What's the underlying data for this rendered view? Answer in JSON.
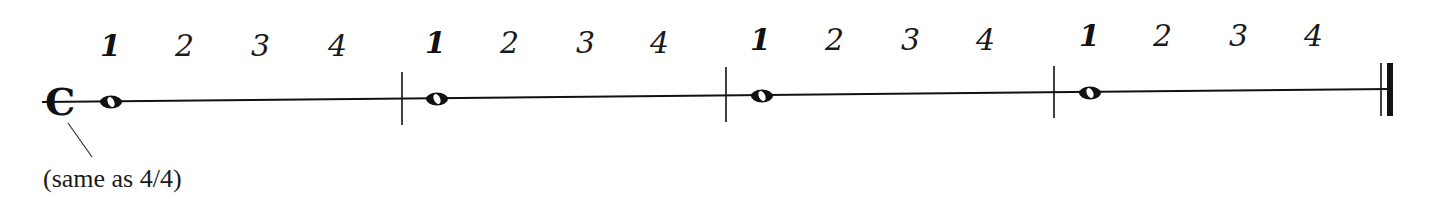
{
  "diagram": {
    "time_signature": {
      "symbol": "C",
      "meaning": "common time",
      "annotation": "(same as 4/4)"
    },
    "measures": [
      {
        "beats": [
          "1",
          "2",
          "3",
          "4"
        ],
        "note": "whole note"
      },
      {
        "beats": [
          "1",
          "2",
          "3",
          "4"
        ],
        "note": "whole note"
      },
      {
        "beats": [
          "1",
          "2",
          "3",
          "4"
        ],
        "note": "whole note"
      },
      {
        "beats": [
          "1",
          "2",
          "3",
          "4"
        ],
        "note": "whole note"
      }
    ],
    "colors": {
      "ink": "#111111",
      "background": "#ffffff"
    }
  }
}
